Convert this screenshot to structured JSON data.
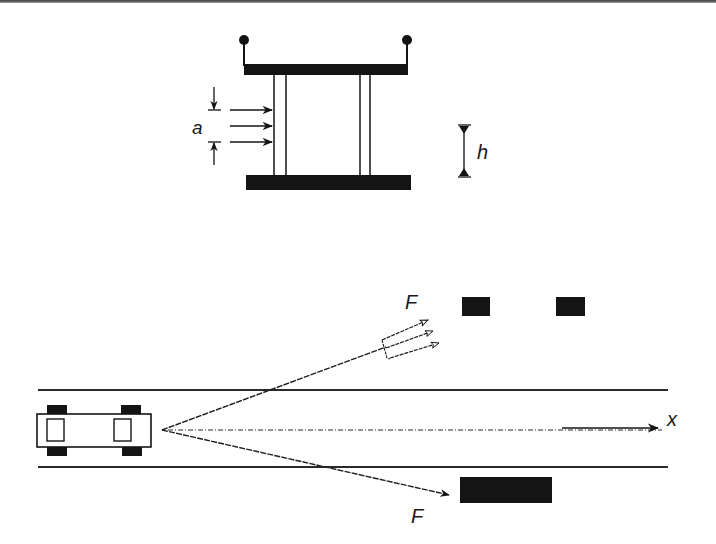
{
  "figure": {
    "top_panel": {
      "name": "structure-under-lateral-load",
      "labels": {
        "a": "a",
        "h": "h"
      },
      "description": "Two-column frame with top and bottom beams; distributed lateral load of width a applied to left column; height dimension h"
    },
    "bottom_panel": {
      "name": "vehicle-impact-road-layout",
      "labels": {
        "force_upper": "F",
        "force_lower": "F",
        "axis": "x"
      },
      "description": "Vehicle on road with centerline axis x; impact force vectors F diverging toward roadside obstacles"
    }
  },
  "colors": {
    "ink": "#141414",
    "line": "#2a2a2a",
    "background": "#ffffff"
  }
}
